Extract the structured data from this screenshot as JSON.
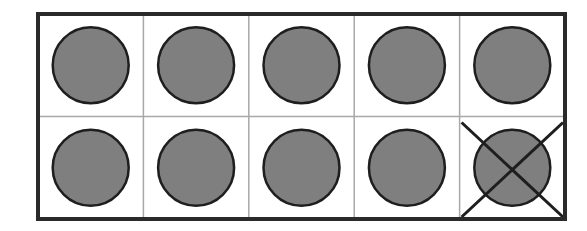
{
  "diagram": {
    "type": "ten-frame",
    "rows": 2,
    "columns": 5,
    "total_counters": 10,
    "crossed_out_counters": 1,
    "remaining_counters": 9,
    "colors": {
      "frame": "#2a2a2a",
      "grid": "#a8a8a8",
      "counter_fill": "#7f7f7f",
      "counter_stroke": "#1e1e1e",
      "cross": "#1e1e1e",
      "background": "#ffffff"
    },
    "cells": [
      {
        "row": 0,
        "col": 0,
        "counter": true,
        "crossed": false
      },
      {
        "row": 0,
        "col": 1,
        "counter": true,
        "crossed": false
      },
      {
        "row": 0,
        "col": 2,
        "counter": true,
        "crossed": false
      },
      {
        "row": 0,
        "col": 3,
        "counter": true,
        "crossed": false
      },
      {
        "row": 0,
        "col": 4,
        "counter": true,
        "crossed": false
      },
      {
        "row": 1,
        "col": 0,
        "counter": true,
        "crossed": false
      },
      {
        "row": 1,
        "col": 1,
        "counter": true,
        "crossed": false
      },
      {
        "row": 1,
        "col": 2,
        "counter": true,
        "crossed": false
      },
      {
        "row": 1,
        "col": 3,
        "counter": true,
        "crossed": false
      },
      {
        "row": 1,
        "col": 4,
        "counter": true,
        "crossed": true
      }
    ]
  }
}
